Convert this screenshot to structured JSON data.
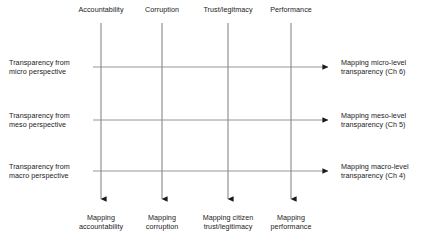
{
  "diagram": {
    "colors": {
      "line": "#7d7d7d",
      "arrow": "#1a1a1a",
      "text": "#1a1a1a",
      "background": "#ffffff"
    },
    "columns": [
      {
        "id": "accountability",
        "header": "Accountability",
        "footer": "Mapping\naccountability",
        "x": 101
      },
      {
        "id": "corruption",
        "header": "Corruption",
        "footer": "Mapping\ncorruption",
        "x": 162
      },
      {
        "id": "trust-legitimacy",
        "header": "Trust/legitmacy",
        "footer": "Mapping citizen\ntrust/legitimacy",
        "x": 228
      },
      {
        "id": "performance",
        "header": "Performance",
        "footer": "Mapping\nperformance",
        "x": 291
      }
    ],
    "rows": [
      {
        "id": "micro",
        "left": "Transparency from\nmicro perspective",
        "right": "Mapping micro-level\ntransparency (Ch 6)",
        "y": 67
      },
      {
        "id": "meso",
        "left": "Transparency from\nmeso perspective",
        "right": "Mapping meso-level\ntransparency (Ch 5)",
        "y": 120
      },
      {
        "id": "macro",
        "left": "Transparency from\nmacro perspective",
        "right": "Mapping macro-level\ntransparency (Ch 4)",
        "y": 171
      }
    ],
    "geometry": {
      "column_line_top": 23,
      "column_line_bottom": 205,
      "row_line_left": 93,
      "row_line_right": 334,
      "header_baseline_y": 10,
      "footer_top_y": 213,
      "left_text_x": 9,
      "right_text_x": 341
    }
  }
}
